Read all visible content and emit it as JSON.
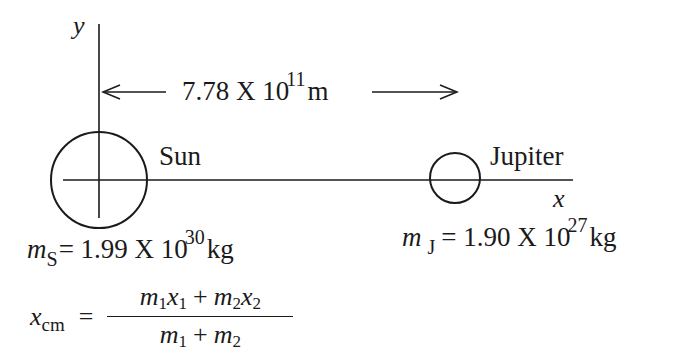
{
  "diagram": {
    "axes": {
      "x_label": "x",
      "y_label": "y"
    },
    "distance": {
      "mantissa": "7.78 X 10",
      "exponent": "11",
      "unit": "m",
      "arrow_left": "←",
      "arrow_right": "→"
    },
    "bodies": [
      {
        "name": "Sun",
        "mass_symbol": "m",
        "mass_subscript": "S",
        "mass_mantissa": "= 1.99 X 10",
        "mass_exponent": "30",
        "mass_unit": "kg",
        "radius_px": 48
      },
      {
        "name": "Jupiter",
        "mass_symbol": "m",
        "mass_subscript": "J",
        "mass_mantissa": "= 1.90 X 10",
        "mass_exponent": "27",
        "mass_unit": "kg",
        "radius_px": 25
      }
    ],
    "formula": {
      "lhs_var": "x",
      "lhs_sub": "cm",
      "equals": "=",
      "numerator": {
        "t1_var": "m",
        "t1_sub": "1",
        "t2_var": "x",
        "t2_sub": "1",
        "plus": "+",
        "t3_var": "m",
        "t3_sub": "2",
        "t4_var": "x",
        "t4_sub": "2"
      },
      "denominator": {
        "t1_var": "m",
        "t1_sub": "1",
        "plus": "+",
        "t2_var": "m",
        "t2_sub": "2"
      }
    },
    "colors": {
      "ink": "#1a1a1a",
      "background": "#ffffff"
    }
  }
}
